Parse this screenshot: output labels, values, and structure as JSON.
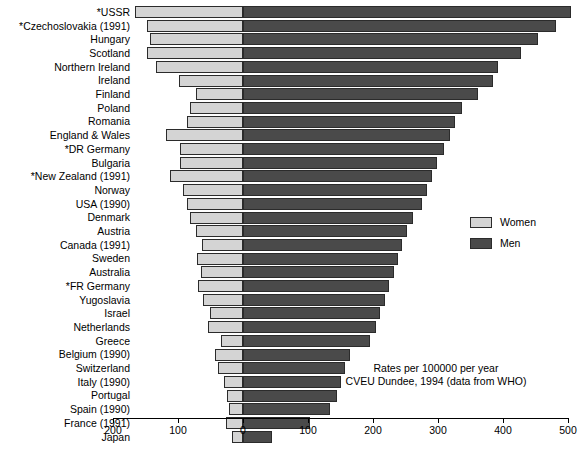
{
  "chart": {
    "type": "bar",
    "orientation": "horizontal-diverging",
    "legend": {
      "position": "right-middle",
      "entries": [
        {
          "label": "Women",
          "color": "#d4d4d4"
        },
        {
          "label": "Men",
          "color": "#4a4a4a"
        }
      ]
    },
    "annotation": {
      "line1": "Rates per 100000 per year",
      "line2": "CVEU Dundee, 1994 (data from WHO)"
    },
    "axis": {
      "ticks": [
        {
          "label": "200",
          "value": -200
        },
        {
          "label": "100",
          "value": -100
        },
        {
          "label": "0",
          "value": 0
        },
        {
          "label": "100",
          "value": 100
        },
        {
          "label": "200",
          "value": 200
        },
        {
          "label": "300",
          "value": 300
        },
        {
          "label": "400",
          "value": 400
        },
        {
          "label": "500",
          "value": 500
        }
      ],
      "left_max": 200,
      "right_max": 500
    }
  },
  "chart_data": {
    "type": "bar",
    "title": "",
    "subtitle": "",
    "xlabel": "Rates per 100000 per year",
    "ylabel": "",
    "xlim": [
      -200,
      500
    ],
    "grid": false,
    "legend_position": "right",
    "orientation": "horizontal",
    "note": "Diverging (back-to-back) bar chart: Women extend left from zero, Men extend right from zero.",
    "categories": [
      "*USSR",
      "*Czechoslovakia (1991)",
      "Hungary",
      "Scotland",
      "Northern Ireland",
      "Ireland",
      "Finland",
      "Poland",
      "Romania",
      "England & Wales",
      "*DR Germany",
      "Bulgaria",
      "*New Zealand (1991)",
      "Norway",
      "USA (1990)",
      "Denmark",
      "Austria",
      "Canada (1991)",
      "Sweden",
      "Australia",
      "*FR Germany",
      "Yugoslavia",
      "Israel",
      "Netherlands",
      "Greece",
      "Belgium (1990)",
      "Switzerland",
      "Italy (1990)",
      "Portugal",
      "Spain (1990)",
      "France (1991)",
      "Japan"
    ],
    "series": [
      {
        "name": "Women",
        "color": "#d4d4d4",
        "direction": "left",
        "values": [
          166,
          148,
          143,
          148,
          134,
          98,
          72,
          82,
          86,
          118,
          97,
          97,
          113,
          93,
          86,
          82,
          72,
          63,
          71,
          65,
          69,
          62,
          51,
          54,
          34,
          43,
          38,
          29,
          25,
          22,
          26,
          17
        ]
      },
      {
        "name": "Men",
        "color": "#4a4a4a",
        "direction": "right",
        "values": [
          504,
          481,
          454,
          428,
          392,
          385,
          362,
          337,
          326,
          318,
          309,
          298,
          291,
          283,
          275,
          262,
          252,
          245,
          238,
          232,
          225,
          218,
          211,
          204,
          196,
          165,
          157,
          151,
          145,
          134,
          103,
          45
        ]
      }
    ]
  }
}
